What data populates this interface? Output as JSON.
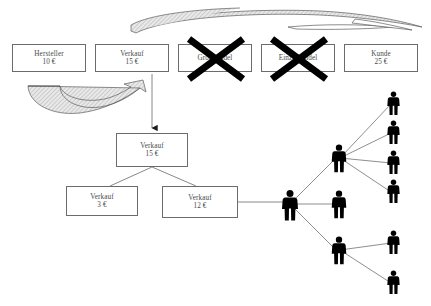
{
  "diagram": {
    "background_color": "#ffffff",
    "box_border_color": "#6b6b6b",
    "box_text_color": "#4a4a4a",
    "line_color": "#7a7a7a",
    "person_color": "#000000",
    "cross_color": "#000000",
    "currency": "€"
  },
  "chain_row": {
    "name": "traditioneller-vertriebsweg",
    "boxes": [
      {
        "label": "Hersteller",
        "amount": "10 €",
        "crossed_out": false
      },
      {
        "label": "Verkauf",
        "amount": "15 €",
        "crossed_out": false
      },
      {
        "label": "Großhandel",
        "amount": "",
        "crossed_out": true
      },
      {
        "label": "Einzelhandel",
        "amount": "",
        "crossed_out": true
      },
      {
        "label": "Kunde",
        "amount": "25 €",
        "crossed_out": false
      }
    ]
  },
  "direct_chain": {
    "name": "direktvertrieb",
    "top_box": {
      "label": "Verkauf",
      "amount": "15 €"
    },
    "left_box": {
      "label": "Verkauf",
      "amount": "3 €"
    },
    "right_box": {
      "label": "Verkauf",
      "amount": "12 €"
    }
  },
  "network": {
    "name": "vertriebsnetz",
    "levels": [
      {
        "level": 1,
        "count": 1
      },
      {
        "level": 2,
        "count": 3
      },
      {
        "level": 3,
        "count": 6
      }
    ],
    "total_people": 10
  },
  "arrows": {
    "long_top_curve": "geschwungener-pfeil-nach-rechts",
    "short_curve": "geschwungener-pfeil-nach-rechts-oben",
    "vertical_arrow": "pfeil-nach-unten"
  }
}
